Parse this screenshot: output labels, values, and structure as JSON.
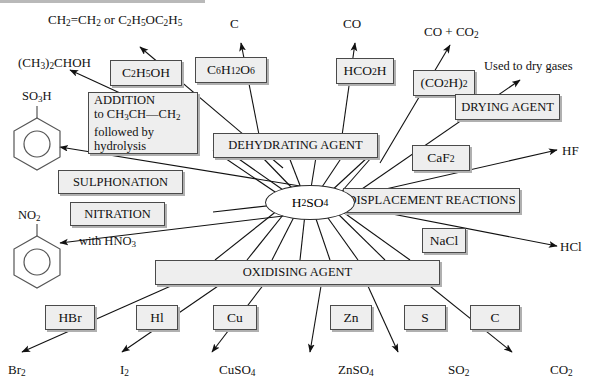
{
  "diagram": {
    "center": {
      "label": "H2SO4",
      "html": "H<sub>2</sub>SO<sub>4</sub>"
    },
    "colors": {
      "box_fill": "#eeeeee",
      "box_border": "#4a4a4a",
      "arrow": "#111111",
      "background": "#ffffff"
    }
  },
  "role_boxes": [
    {
      "id": "dehydrating",
      "label": "DEHYDRATING AGENT"
    },
    {
      "id": "drying",
      "label": "DRYING AGENT"
    },
    {
      "id": "displacement",
      "label": "DISPLACEMENT REACTIONS"
    },
    {
      "id": "oxidising",
      "label": "OXIDISING AGENT"
    },
    {
      "id": "sulphonation",
      "label": "SULPHONATION"
    },
    {
      "id": "nitration",
      "label": "NITRATION"
    },
    {
      "id": "addition",
      "label": "ADDITION to CH3CH=CH2 followed by hydrolysis",
      "line1": "ADDITION",
      "line2_html": "to CH<sub>3</sub>CH&#8212;CH<sub>2</sub>",
      "line3": "followed by",
      "line4": "hydrolysis"
    }
  ],
  "reagent_boxes": [
    {
      "id": "ethanol",
      "label": "C2H5OH",
      "html": "C<sub>2</sub>H<sub>5</sub>OH"
    },
    {
      "id": "glucose",
      "label": "C6H12O6",
      "html": "C<sub>6</sub>H<sub>12</sub>O<sub>6</sub>"
    },
    {
      "id": "formic",
      "label": "HCO2H",
      "html": "HCO<sub>2</sub>H"
    },
    {
      "id": "oxalic",
      "label": "(CO2H)2",
      "html": "(CO<sub>2</sub>H)<sub>2</sub>"
    },
    {
      "id": "caf2",
      "label": "CaF2",
      "html": "CaF<sub>2</sub>"
    },
    {
      "id": "nacl",
      "label": "NaCl",
      "html": "NaCl"
    },
    {
      "id": "hbr",
      "label": "HBr",
      "html": "HBr"
    },
    {
      "id": "hi",
      "label": "HI",
      "html": "Hl"
    },
    {
      "id": "cu",
      "label": "Cu",
      "html": "Cu"
    },
    {
      "id": "zn",
      "label": "Zn",
      "html": "Zn"
    },
    {
      "id": "s",
      "label": "S",
      "html": "S"
    },
    {
      "id": "c",
      "label": "C",
      "html": "C"
    }
  ],
  "product_labels": [
    {
      "id": "ethene-ether",
      "label": "CH2=CH2 or C2H5OC2H5",
      "html": "CH<sub>2</sub><span class=\"eq\">&#61;</span>CH<sub>2</sub> or C<sub>2</sub>H<sub>5</sub>OC<sub>2</sub>H<sub>5</sub>"
    },
    {
      "id": "carbon",
      "label": "C",
      "html": "C"
    },
    {
      "id": "co",
      "label": "CO",
      "html": "CO"
    },
    {
      "id": "co-co2",
      "label": "CO + CO2",
      "html": "CO + CO<sub>2</sub>"
    },
    {
      "id": "dry-gases",
      "label": "Used to dry gases",
      "html": "Used to dry gases"
    },
    {
      "id": "propanol",
      "label": "(CH3)2CHOH",
      "html": "(CH<sub>3</sub>)<sub>2</sub>CHOH"
    },
    {
      "id": "hf",
      "label": "HF",
      "html": "HF"
    },
    {
      "id": "hcl",
      "label": "HCl",
      "html": "HCl"
    },
    {
      "id": "br2",
      "label": "Br2",
      "html": "Br<sub>2</sub>"
    },
    {
      "id": "i2",
      "label": "I2",
      "html": "I<sub>2</sub>"
    },
    {
      "id": "cuso4",
      "label": "CuSO4",
      "html": "CuSO<sub>4</sub>"
    },
    {
      "id": "znso4",
      "label": "ZnSO4",
      "html": "ZnSO<sub>4</sub>"
    },
    {
      "id": "so2",
      "label": "SO2",
      "html": "SO<sub>2</sub>"
    },
    {
      "id": "co2",
      "label": "CO2",
      "html": "CO<sub>2</sub>"
    },
    {
      "id": "so3h",
      "label": "SO3H",
      "html": "SO<sub>3</sub>H"
    },
    {
      "id": "no2",
      "label": "NO2",
      "html": "NO<sub>2</sub>"
    },
    {
      "id": "with-hno3",
      "label": "with HNO3",
      "html": "with HNO<sub>3</sub>"
    }
  ],
  "structures": [
    {
      "id": "benzenesulphonic-acid",
      "substituent": "SO3H"
    },
    {
      "id": "nitrobenzene",
      "substituent": "NO2"
    }
  ]
}
